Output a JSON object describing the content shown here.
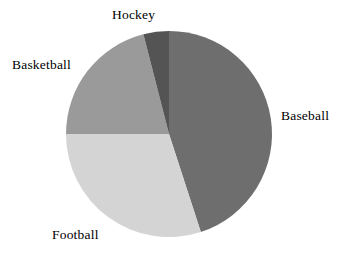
{
  "chart_data": {
    "type": "pie",
    "title": "",
    "xlabel": "",
    "ylabel": "",
    "legend_position": "outside-labels",
    "grid": false,
    "start_angle_deg": 0,
    "direction": "clockwise",
    "center": {
      "x": 169,
      "y": 134
    },
    "radius": 103,
    "categories": [
      "Baseball",
      "Football",
      "Basketball",
      "Hockey"
    ],
    "values": [
      45,
      30,
      21,
      4
    ],
    "colors": [
      "#6e6e6e",
      "#d4d4d4",
      "#9a9a9a",
      "#545454"
    ],
    "slices": [
      {
        "label": "Baseball",
        "value": 45,
        "percent": "45%",
        "color": "#6e6e6e",
        "start_deg": 0,
        "end_deg": 162
      },
      {
        "label": "Football",
        "value": 30,
        "percent": "30%",
        "color": "#d4d4d4",
        "start_deg": 162,
        "end_deg": 270
      },
      {
        "label": "Basketball",
        "value": 21,
        "percent": "21%",
        "color": "#9a9a9a",
        "start_deg": 270,
        "end_deg": 345.6
      },
      {
        "label": "Hockey",
        "value": 4,
        "percent": "4%",
        "color": "#545454",
        "start_deg": 345.6,
        "end_deg": 360
      }
    ]
  },
  "labels": {
    "baseball": "Baseball",
    "football": "Football",
    "basketball": "Basketball",
    "hockey": "Hockey"
  },
  "background_color": "#ffffff",
  "text_color": "#000000"
}
